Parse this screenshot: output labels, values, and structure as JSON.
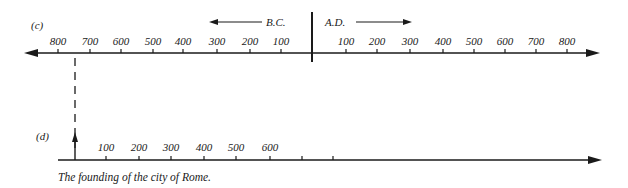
{
  "diagram_c": {
    "label": "(c)",
    "bc_label": "B.C.",
    "ad_label": "A.D.",
    "bc_ticks": [
      {
        "label": "800",
        "x": 58
      },
      {
        "label": "700",
        "x": 90
      },
      {
        "label": "600",
        "x": 121
      },
      {
        "label": "500",
        "x": 153
      },
      {
        "label": "400",
        "x": 183
      },
      {
        "label": "300",
        "x": 217
      },
      {
        "label": "200",
        "x": 250
      },
      {
        "label": "100",
        "x": 281
      }
    ],
    "ad_ticks": [
      {
        "label": "100",
        "x": 346
      },
      {
        "label": "200",
        "x": 377
      },
      {
        "label": "300",
        "x": 410
      },
      {
        "label": "400",
        "x": 443
      },
      {
        "label": "500",
        "x": 474
      },
      {
        "label": "600",
        "x": 505
      },
      {
        "label": "700",
        "x": 536
      },
      {
        "label": "800",
        "x": 567
      }
    ]
  },
  "diagram_d": {
    "label": "(d)",
    "ticks": [
      {
        "label": "100",
        "x": 106
      },
      {
        "label": "200",
        "x": 139
      },
      {
        "label": "300",
        "x": 171
      },
      {
        "label": "400",
        "x": 204
      },
      {
        "label": "500",
        "x": 236
      },
      {
        "label": "600",
        "x": 270
      },
      {
        "label": "",
        "x": 302
      },
      {
        "label": "",
        "x": 333
      }
    ],
    "caption": "The founding of the city of Rome."
  },
  "colors": {
    "ink": "#1a1a1a",
    "background": "#ffffff"
  }
}
